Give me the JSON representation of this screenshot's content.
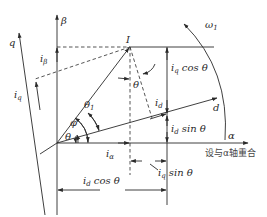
{
  "diagram": {
    "axes": {
      "alpha": "α",
      "beta": "β",
      "d": "d",
      "q": "q"
    },
    "vectors": {
      "current": "I",
      "rotation_speed": "ω",
      "rotation_speed_sub": "1"
    },
    "angles": {
      "theta": "θ",
      "phi": "φ",
      "theta1": "θ",
      "theta1_sub": "1",
      "theta_top": "θ"
    },
    "components": {
      "i_alpha": {
        "base": "i",
        "sub": "α"
      },
      "i_beta": {
        "base": "i",
        "sub": "β"
      },
      "i_d": {
        "base": "i",
        "sub": "d"
      },
      "i_q": {
        "base": "i",
        "sub": "q"
      }
    },
    "projections": {
      "iq_cos": {
        "base": "i",
        "sub": "q",
        "rest": " cos θ"
      },
      "id_sin": {
        "base": "i",
        "sub": "d",
        "rest": " sin θ"
      },
      "iq_sin": {
        "base": "i",
        "sub": "q",
        "rest": " sin θ"
      },
      "id_cos": {
        "base": "i",
        "sub": "d",
        "rest": " cos θ"
      }
    },
    "caption": "设与α轴重合"
  }
}
